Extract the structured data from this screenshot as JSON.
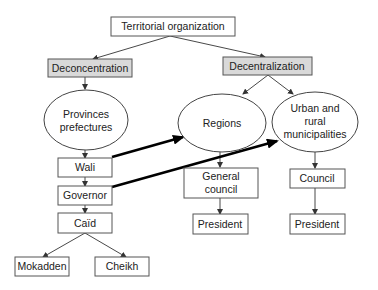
{
  "diagram": {
    "root": "Territorial organization",
    "left_branch": {
      "label": "Deconcentration",
      "ellipse": [
        "Provinces",
        "prefectures"
      ],
      "chain": [
        "Wali",
        "Governor",
        "Caïd"
      ],
      "leaves": [
        "Mokadden",
        "Cheikh"
      ]
    },
    "right_branch": {
      "label": "Decentralization",
      "regions": {
        "ellipse": "Regions",
        "council": [
          "General",
          "council"
        ],
        "president": "President"
      },
      "municipalities": {
        "ellipse": [
          "Urban and",
          "rural",
          "municipalities"
        ],
        "council": "Council",
        "president": "President"
      }
    },
    "cross_links": [
      {
        "from": "Wali",
        "to": "Regions"
      },
      {
        "from": "Governor",
        "to": "Urban and rural municipalities"
      }
    ],
    "colors": {
      "gray_box_fill": "#d9d9d9",
      "border": "#555555",
      "thick_arrow": "#000000"
    }
  }
}
